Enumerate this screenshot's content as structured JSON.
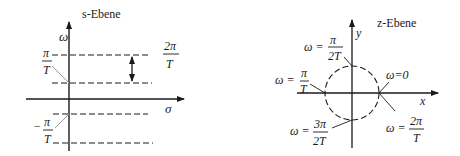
{
  "s_plane": {
    "title": "s-Ebene",
    "vertical_axis_label": "ω",
    "horizontal_axis_label": "σ",
    "period_label": {
      "numerator": "2π",
      "denominator": "T"
    },
    "upper_label": {
      "sign": "",
      "numerator": "π",
      "denominator": "T"
    },
    "lower_label": {
      "sign": "−",
      "numerator": "π",
      "denominator": "T"
    }
  },
  "z_plane": {
    "title": "z-Ebene",
    "x_axis_label": "x",
    "y_axis_label": "y",
    "points": [
      {
        "id": "top",
        "prefix": "ω =",
        "numerator": "π",
        "denominator": "2T"
      },
      {
        "id": "left",
        "prefix": "ω =",
        "numerator": "π",
        "denominator": "T"
      },
      {
        "id": "right-zero",
        "text": "ω=0"
      },
      {
        "id": "bottom",
        "prefix": "ω =",
        "numerator": "3π",
        "denominator": "2T"
      },
      {
        "id": "right-full",
        "prefix": "ω =",
        "numerator": "2π",
        "denominator": "T"
      }
    ]
  },
  "colors": {
    "stroke": "#1a1a1a",
    "leader": "#9a9a9a",
    "background": "#ffffff"
  }
}
